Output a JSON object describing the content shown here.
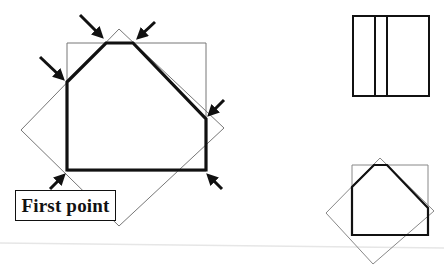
{
  "diagram": {
    "label": "First point",
    "colors": {
      "thick_outline": "#111111",
      "thin_outline": "#777777",
      "separator": "#e6e6e6",
      "background": "#ffffff"
    },
    "main_figure": {
      "square": [
        [
          67,
          43
        ],
        [
          206,
          43
        ],
        [
          206,
          171
        ],
        [
          67,
          171
        ]
      ],
      "diamond": [
        [
          119,
          29
        ],
        [
          224,
          128
        ],
        [
          119,
          226
        ],
        [
          21,
          130
        ]
      ],
      "clipped_polygon": [
        [
          67,
          170
        ],
        [
          67,
          82
        ],
        [
          106,
          43
        ],
        [
          133,
          43
        ],
        [
          206,
          119
        ],
        [
          206,
          170
        ]
      ],
      "arrows": [
        {
          "from": [
            80,
            15
          ],
          "to": [
            103,
            38
          ],
          "target": "top-left intersection"
        },
        {
          "from": [
            155,
            22
          ],
          "to": [
            138,
            38
          ],
          "target": "top-right intersection"
        },
        {
          "from": [
            40,
            57
          ],
          "to": [
            64,
            80
          ],
          "target": "left intersection"
        },
        {
          "from": [
            224,
            100
          ],
          "to": [
            209,
            115
          ],
          "target": "right intersection"
        },
        {
          "from": [
            222,
            189
          ],
          "to": [
            208,
            175
          ],
          "target": "bottom-right corner"
        },
        {
          "from": [
            50,
            189
          ],
          "to": [
            64,
            175
          ],
          "target": "first point"
        }
      ]
    },
    "top_right_figure": {
      "rect": [
        353,
        16,
        429,
        96
      ],
      "dividers_x": [
        375,
        387
      ]
    },
    "bottom_right_figure": {
      "square": [
        [
          352,
          165
        ],
        [
          428,
          165
        ],
        [
          428,
          235
        ],
        [
          352,
          235
        ]
      ],
      "diamond": [
        [
          380,
          158
        ],
        [
          434,
          211
        ],
        [
          373,
          264
        ],
        [
          326,
          213
        ]
      ],
      "clipped_polygon": [
        [
          352,
          235
        ],
        [
          352,
          187
        ],
        [
          374,
          165
        ],
        [
          387,
          165
        ],
        [
          428,
          208
        ],
        [
          428,
          235
        ]
      ]
    }
  }
}
